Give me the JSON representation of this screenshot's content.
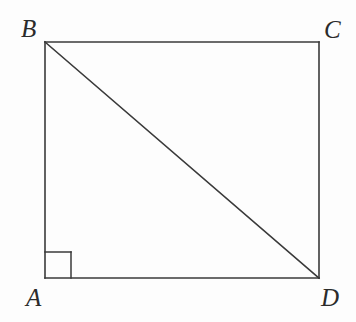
{
  "figure": {
    "kind": "geometry-diagram",
    "background_color": "#fdfdfd",
    "stroke_color": "#3a3a3a",
    "label_color": "#2b2b2b",
    "stroke_width": 1.6,
    "vertices": [
      {
        "id": "A",
        "label": "A",
        "x": 45,
        "y": 278,
        "label_x": 26,
        "label_y": 285
      },
      {
        "id": "B",
        "label": "B",
        "x": 45,
        "y": 42,
        "label_x": 21,
        "label_y": 16
      },
      {
        "id": "C",
        "label": "C",
        "x": 319,
        "y": 42,
        "label_x": 324,
        "label_y": 17
      },
      {
        "id": "D",
        "label": "D",
        "x": 319,
        "y": 278,
        "label_x": 321,
        "label_y": 285
      }
    ],
    "edges": [
      {
        "id": "AB",
        "from": "A",
        "to": "B",
        "kind": "side"
      },
      {
        "id": "BC",
        "from": "B",
        "to": "C",
        "kind": "side"
      },
      {
        "id": "CD",
        "from": "C",
        "to": "D",
        "kind": "side"
      },
      {
        "id": "DA",
        "from": "D",
        "to": "A",
        "kind": "side"
      },
      {
        "id": "BD",
        "from": "B",
        "to": "D",
        "kind": "diagonal"
      }
    ],
    "right_angle_marker": {
      "at_vertex": "A",
      "size": 26,
      "x": 45,
      "y": 252,
      "width": 26,
      "height": 26
    }
  }
}
